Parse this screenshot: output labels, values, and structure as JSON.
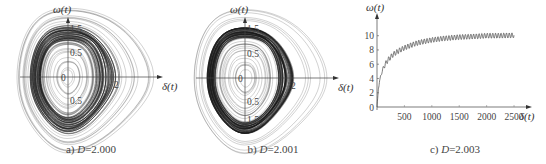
{
  "figure": {
    "panels": [
      {
        "id": "a",
        "caption_prefix": "a) ",
        "caption_var": "D",
        "caption_value": "=2.000",
        "type": "phase"
      },
      {
        "id": "b",
        "caption_prefix": "b) ",
        "caption_var": "D",
        "caption_value": "=2.001",
        "type": "phase"
      },
      {
        "id": "c",
        "caption_prefix": "c) ",
        "caption_var": "D",
        "caption_value": "=2.003",
        "type": "line"
      }
    ]
  },
  "chart_data": [
    {
      "type": "scatter",
      "title": "a) D=2.000",
      "xlabel": "δ(t)",
      "ylabel": "ω(t)",
      "description": "Phase portrait: nested closed quasi-elliptical orbits around origin, dense dark band mid-radius, outer orbits extend farther to the right (teardrop shape)",
      "tick_labels": {
        "y": [
          "1.5",
          "0.5",
          "0",
          "-0.5"
        ],
        "x": [
          "0",
          "2"
        ]
      },
      "xlim": [
        -2.2,
        4.8
      ],
      "ylim": [
        -2.0,
        2.0
      ],
      "grid": false
    },
    {
      "type": "scatter",
      "title": "b) D=2.001",
      "xlabel": "δ(t)",
      "ylabel": "ω(t)",
      "description": "Phase portrait: nested closed orbits, a single very dense dark ring at mid radius, sparse outer orbits extending right",
      "tick_labels": {
        "y": [
          "1.5",
          "0.5",
          "0",
          "-0.5",
          "-1.5"
        ],
        "x": [
          "0",
          "2"
        ]
      },
      "xlim": [
        -2.2,
        4.8
      ],
      "ylim": [
        -2.0,
        2.0
      ],
      "grid": false
    },
    {
      "type": "line",
      "title": "c) D=2.003",
      "xlabel": "δ(t)",
      "ylabel": "ω(t)",
      "x": [
        0,
        25,
        50,
        100,
        150,
        200,
        300,
        400,
        500,
        600,
        700,
        800,
        1000,
        1200,
        1500,
        1800,
        2000,
        2200,
        2500
      ],
      "values": [
        0,
        2.5,
        3.8,
        5.2,
        6.0,
        6.6,
        7.4,
        7.9,
        8.3,
        8.6,
        8.9,
        9.1,
        9.4,
        9.6,
        9.8,
        9.9,
        10.0,
        10.0,
        10.05
      ],
      "oscillation_amplitude": 0.35,
      "xticks": [
        0,
        500,
        1000,
        1500,
        2000,
        2500
      ],
      "yticks": [
        0,
        2,
        4,
        6,
        8,
        10
      ],
      "xlim": [
        0,
        2700
      ],
      "ylim": [
        0,
        11.5
      ],
      "grid": false
    }
  ]
}
